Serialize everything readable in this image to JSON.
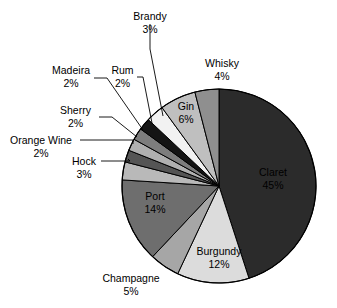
{
  "chart_data": {
    "type": "pie",
    "title": "",
    "legend_position": "none",
    "labels_inside": [
      "Claret",
      "Burgundy",
      "Port",
      "Gin"
    ],
    "categories": [
      "Claret",
      "Burgundy",
      "Port",
      "Gin",
      "Champagne",
      "Whisky",
      "Brandy",
      "Hock",
      "Rum",
      "Madeira",
      "Sherry",
      "Orange Wine"
    ],
    "values": [
      45,
      12,
      14,
      6,
      5,
      4,
      3,
      3,
      2,
      2,
      2,
      2
    ],
    "unit": "%",
    "slices": [
      {
        "name": "Claret",
        "value": 45,
        "value_label": "45%",
        "color": "#2b2b2b",
        "text_color": "#000000",
        "label_placement": "inside"
      },
      {
        "name": "Burgundy",
        "value": 12,
        "value_label": "12%",
        "color": "#dcdcdc",
        "text_color": "#000000",
        "label_placement": "inside"
      },
      {
        "name": "Champagne",
        "value": 5,
        "value_label": "5%",
        "color": "#a6a6a6",
        "text_color": "#000000",
        "label_placement": "outside"
      },
      {
        "name": "Port",
        "value": 14,
        "value_label": "14%",
        "color": "#6e6e6e",
        "text_color": "#000000",
        "label_placement": "inside"
      },
      {
        "name": "Hock",
        "value": 3,
        "value_label": "3%",
        "color": "#b9b9b9",
        "text_color": "#000000",
        "label_placement": "outside"
      },
      {
        "name": "Orange Wine",
        "value": 2,
        "value_label": "2%",
        "color": "#555555",
        "text_color": "#000000",
        "label_placement": "outside"
      },
      {
        "name": "Sherry",
        "value": 2,
        "value_label": "2%",
        "color": "#b0b0b0",
        "text_color": "#000000",
        "label_placement": "outside"
      },
      {
        "name": "Madeira",
        "value": 2,
        "value_label": "2%",
        "color": "#7d7d7d",
        "text_color": "#000000",
        "label_placement": "outside"
      },
      {
        "name": "Rum",
        "value": 2,
        "value_label": "2%",
        "color": "#141414",
        "text_color": "#000000",
        "label_placement": "outside"
      },
      {
        "name": "Brandy",
        "value": 3,
        "value_label": "3%",
        "color": "#f2f2f2",
        "text_color": "#000000",
        "label_placement": "outside"
      },
      {
        "name": "Gin",
        "value": 6,
        "value_label": "6%",
        "color": "#bfbfbf",
        "text_color": "#000000",
        "label_placement": "inside"
      },
      {
        "name": "Whisky",
        "value": 4,
        "value_label": "4%",
        "color": "#8f8f8f",
        "text_color": "#000000",
        "label_placement": "outside"
      }
    ]
  },
  "labels": {
    "brandy": {
      "name": "Brandy",
      "pct": "3%"
    },
    "whisky": {
      "name": "Whisky",
      "pct": "4%"
    },
    "madeira": {
      "name": "Madeira",
      "pct": "2%"
    },
    "rum": {
      "name": "Rum",
      "pct": "2%"
    },
    "sherry": {
      "name": "Sherry",
      "pct": "2%"
    },
    "orange_wine": {
      "name": "Orange Wine",
      "pct": "2%"
    },
    "hock": {
      "name": "Hock",
      "pct": "3%"
    },
    "champagne": {
      "name": "Champagne",
      "pct": "5%"
    },
    "port": {
      "name": "Port",
      "pct": "14%"
    },
    "burgundy": {
      "name": "Burgundy",
      "pct": "12%"
    },
    "claret": {
      "name": "Claret",
      "pct": "45%"
    },
    "gin": {
      "name": "Gin",
      "pct": "6%"
    }
  }
}
